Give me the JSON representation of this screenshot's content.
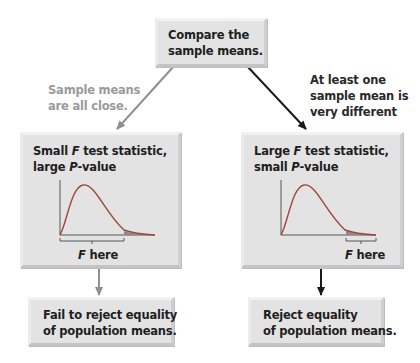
{
  "top_box": {
    "line1": "Compare the",
    "line2": "sample means."
  },
  "branch_left": {
    "annotation": {
      "line1": "Sample means",
      "line2": "are all close."
    },
    "stat_box": {
      "line1_a": "Small ",
      "line1_f": "F",
      "line1_b": " test statistic,",
      "line2_a": "large ",
      "line2_p": "P",
      "line2_b": "-value"
    },
    "f_label": {
      "f": "F",
      "rest": " here"
    },
    "conclusion": {
      "line1": "Fail to reject equality",
      "line2": "of population means."
    }
  },
  "branch_right": {
    "annotation": {
      "line1": "At least one",
      "line2": "sample mean is",
      "line3": "very different"
    },
    "stat_box": {
      "line1_a": "Large ",
      "line1_f": "F",
      "line1_b": " test statistic,",
      "line2_a": "small ",
      "line2_p": "P",
      "line2_b": "-value"
    },
    "f_label": {
      "f": "F",
      "rest": " here"
    },
    "conclusion": {
      "line1": "Reject equality",
      "line2": "of population means."
    }
  },
  "colors": {
    "box_fill": "#e3e3e3",
    "curve": "#a0453a",
    "tail_shade": "#8a8a8a",
    "arrow_gray": "#8f8f8f",
    "arrow_dark": "#1a1a1a",
    "annotation_gray": "#9a9a9a"
  }
}
